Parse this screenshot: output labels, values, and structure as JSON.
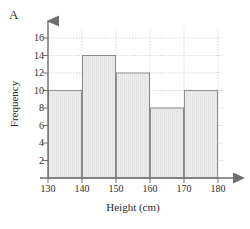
{
  "panel": {
    "label": "A"
  },
  "chart_data": {
    "type": "bar",
    "title": "",
    "subtitle": "",
    "xlabel": "Height (cm)",
    "ylabel": "Frequency",
    "categories": [
      "130-140",
      "140-150",
      "150-160",
      "160-170",
      "170-180"
    ],
    "bin_edges": [
      130,
      140,
      150,
      160,
      170,
      180
    ],
    "values": [
      10,
      14,
      12,
      8,
      10
    ],
    "bin_width": 10,
    "xlim": [
      130,
      180
    ],
    "ylim": [
      0,
      17
    ],
    "xticks": [
      "130",
      "140",
      "150",
      "160",
      "170",
      "180"
    ],
    "yticks": [
      "2",
      "4",
      "6",
      "8",
      "10",
      "12",
      "14",
      "16"
    ],
    "grid": true,
    "grid_style": "dotted",
    "legend": null,
    "legend_position": "none",
    "annotations": [],
    "axis_arrows": [
      "x-right",
      "y-up"
    ]
  },
  "style": {
    "bar_fill": "#ececec",
    "bar_stroke": "#8d8d8d",
    "grid_color": "#b9b9b9",
    "axis_color": "#6e6e6e",
    "text_color": "#2b2b2b",
    "background": "#ffffff"
  }
}
